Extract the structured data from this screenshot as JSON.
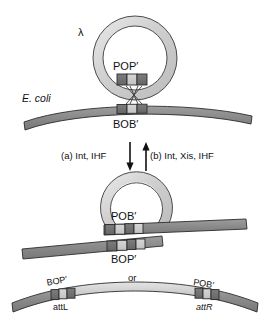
{
  "figure": {
    "title_text": "",
    "labels": {
      "lambda": "λ",
      "ecoli": "E. coli",
      "pop_prime": "POP′",
      "bob_prime": "BOB′",
      "pob_prime_mid": "POB′",
      "bop_prime_mid": "BOP′",
      "bop_prime_left": "BOP′",
      "pob_prime_right": "POB′",
      "attL": "attL",
      "attR": "attR",
      "or": "or",
      "arrow_a": "(a) Int, IHF",
      "arrow_b": "(b) Int, Xis, IHF"
    },
    "colors": {
      "phage_dna_light": "#d4d4d4",
      "phage_dna_mid": "#c0c0c0",
      "host_dna_dark": "#8a8a8a",
      "site_block_dark": "#6e6e6e",
      "site_block_light": "#c9c9c9",
      "outline": "#2b2b2b",
      "text": "#111111",
      "background": "#ffffff"
    },
    "panels": [
      {
        "name": "panel-top",
        "description": "circular lambda phage DNA with POP′ site above curved E. coli chromosome with BOB′ site, crossed strands between them"
      },
      {
        "name": "panel-arrows",
        "description": "two vertical antiparallel reaction arrows with labels"
      },
      {
        "name": "panel-middle",
        "description": "integrated intermediate: lambda circle fused into host chromosome showing POB′ above and BOP′ below"
      },
      {
        "name": "panel-bottom",
        "description": "linear prophage representation with attL on left and attR on right flanking lambda DNA"
      }
    ]
  }
}
